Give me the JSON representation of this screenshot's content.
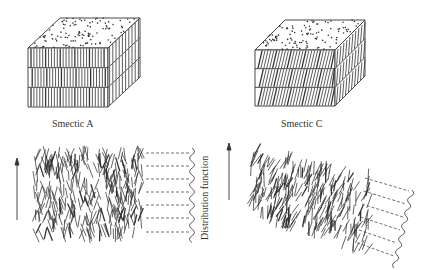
{
  "figure": {
    "panels": [
      {
        "id": "smectic-a-block",
        "caption": "Smectic A",
        "layers": 3,
        "molecule_tilt": "perpendicular to layers"
      },
      {
        "id": "smectic-c-block",
        "caption": "Smectic C",
        "layers": 3,
        "molecule_tilt": "tilted relative to layer normal"
      },
      {
        "id": "smectic-a-molecular",
        "director_arrow": "up",
        "side_label": "Distribution function",
        "dashed_layer_lines": 7
      },
      {
        "id": "smectic-c-molecular",
        "director_arrow": "up",
        "dashed_layer_lines": 6
      }
    ]
  },
  "colors": {
    "line": "#333333",
    "background": "#ffffff"
  }
}
